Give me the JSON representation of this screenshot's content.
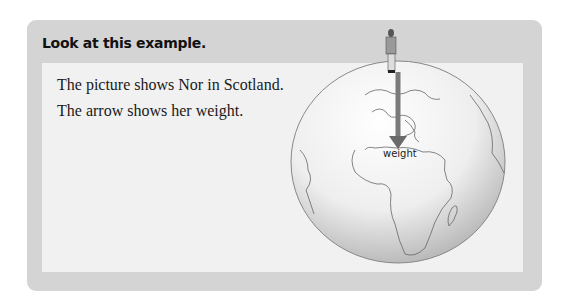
{
  "box": {
    "title": "Look at this example.",
    "lines": [
      "The picture shows Nor in Scotland.",
      "The arrow shows her weight."
    ]
  },
  "figure": {
    "arrow_label": "weight",
    "arrow_color": "#7a7a7a"
  }
}
